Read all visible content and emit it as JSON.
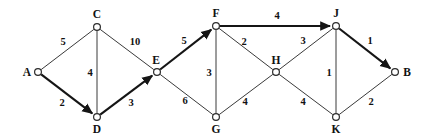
{
  "diagram": {
    "type": "directed-network",
    "colors": {
      "background": "#ffffff",
      "edge": "#3a3a3a",
      "edge_critical": "#151515",
      "node_stroke": "#2b2b2b",
      "node_fill": "#ffffff",
      "text": "#111111"
    },
    "nodes": [
      {
        "id": "A",
        "label": "A",
        "x": 38,
        "y": 72,
        "label_dx": -11,
        "label_dy": 4
      },
      {
        "id": "C",
        "label": "C",
        "x": 97,
        "y": 27,
        "label_dx": 0,
        "label_dy": -9
      },
      {
        "id": "D",
        "label": "D",
        "x": 97,
        "y": 117,
        "label_dx": 0,
        "label_dy": 16
      },
      {
        "id": "E",
        "label": "E",
        "x": 157,
        "y": 72,
        "label_dx": -1,
        "label_dy": -8
      },
      {
        "id": "F",
        "label": "F",
        "x": 216,
        "y": 26,
        "label_dx": 0,
        "label_dy": -9
      },
      {
        "id": "G",
        "label": "G",
        "x": 216,
        "y": 117,
        "label_dx": 0,
        "label_dy": 16
      },
      {
        "id": "H",
        "label": "H",
        "x": 276,
        "y": 72,
        "label_dx": 0,
        "label_dy": -8
      },
      {
        "id": "J",
        "label": "J",
        "x": 336,
        "y": 26,
        "label_dx": 0,
        "label_dy": -9
      },
      {
        "id": "K",
        "label": "K",
        "x": 336,
        "y": 117,
        "label_dx": 0,
        "label_dy": 16
      },
      {
        "id": "B",
        "label": "B",
        "x": 395,
        "y": 72,
        "label_dx": 12,
        "label_dy": 4
      }
    ],
    "edges": [
      {
        "from": "A",
        "to": "C",
        "weight": "5",
        "critical": false,
        "arrow": false,
        "wx": 63,
        "wy": 45
      },
      {
        "from": "A",
        "to": "D",
        "weight": "2",
        "critical": true,
        "arrow": true,
        "wx": 62,
        "wy": 106
      },
      {
        "from": "C",
        "to": "D",
        "weight": "4",
        "critical": false,
        "arrow": false,
        "wx": 90,
        "wy": 76
      },
      {
        "from": "C",
        "to": "E",
        "weight": "10",
        "critical": false,
        "arrow": false,
        "wx": 135,
        "wy": 45
      },
      {
        "from": "D",
        "to": "E",
        "weight": "3",
        "critical": true,
        "arrow": true,
        "wx": 131,
        "wy": 106
      },
      {
        "from": "E",
        "to": "F",
        "weight": "5",
        "critical": true,
        "arrow": true,
        "wx": 184,
        "wy": 44
      },
      {
        "from": "E",
        "to": "G",
        "weight": "6",
        "critical": false,
        "arrow": false,
        "wx": 185,
        "wy": 104
      },
      {
        "from": "F",
        "to": "G",
        "weight": "3",
        "critical": false,
        "arrow": false,
        "wx": 209,
        "wy": 76
      },
      {
        "from": "F",
        "to": "H",
        "weight": "2",
        "critical": false,
        "arrow": false,
        "wx": 244,
        "wy": 45
      },
      {
        "from": "F",
        "to": "J",
        "weight": "4",
        "critical": true,
        "arrow": true,
        "wx": 277,
        "wy": 19
      },
      {
        "from": "G",
        "to": "H",
        "weight": "4",
        "critical": false,
        "arrow": false,
        "wx": 245,
        "wy": 105
      },
      {
        "from": "H",
        "to": "J",
        "weight": "3",
        "critical": false,
        "arrow": false,
        "wx": 303,
        "wy": 44
      },
      {
        "from": "H",
        "to": "K",
        "weight": "4",
        "critical": false,
        "arrow": false,
        "wx": 303,
        "wy": 105
      },
      {
        "from": "J",
        "to": "K",
        "weight": "1",
        "critical": false,
        "arrow": false,
        "wx": 329,
        "wy": 76
      },
      {
        "from": "J",
        "to": "B",
        "weight": "1",
        "critical": true,
        "arrow": true,
        "wx": 370,
        "wy": 44
      },
      {
        "from": "K",
        "to": "B",
        "weight": "2",
        "critical": false,
        "arrow": false,
        "wx": 371,
        "wy": 105
      }
    ]
  }
}
